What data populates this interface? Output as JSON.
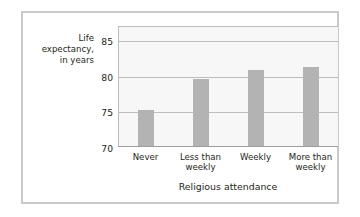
{
  "chart_data": {
    "type": "bar",
    "title": "",
    "categories": [
      "Never",
      "Less than weekly",
      "Weekly",
      "More than weekly"
    ],
    "category_lines": [
      [
        "Never"
      ],
      [
        "Less than",
        "weekly"
      ],
      [
        "Weekly"
      ],
      [
        "More than",
        "weekly"
      ]
    ],
    "values": [
      75.2,
      79.6,
      80.8,
      81.2
    ],
    "series": [
      {
        "name": "Life expectancy",
        "values": [
          75.2,
          79.6,
          80.8,
          81.2
        ]
      }
    ],
    "xlabel": "Religious attendance",
    "ylabel": "Life expectancy, in years",
    "ylabel_lines": [
      "Life",
      "expectancy,",
      "in years"
    ],
    "ylim": [
      70,
      87
    ],
    "yticks": [
      70,
      75,
      80,
      85
    ],
    "ytick_labels": [
      "70",
      "75",
      "80",
      "85"
    ],
    "grid": true,
    "grid_axis": "y",
    "legend": false,
    "legend_position": "none",
    "bar_color": "#b3b3b3",
    "plot_background": "#f7f7f7",
    "gridline_color": "#bdbdbd",
    "axis_color": "#9e9e9e",
    "text_color": "#231f20",
    "frame_color": "#c9c9c9"
  }
}
